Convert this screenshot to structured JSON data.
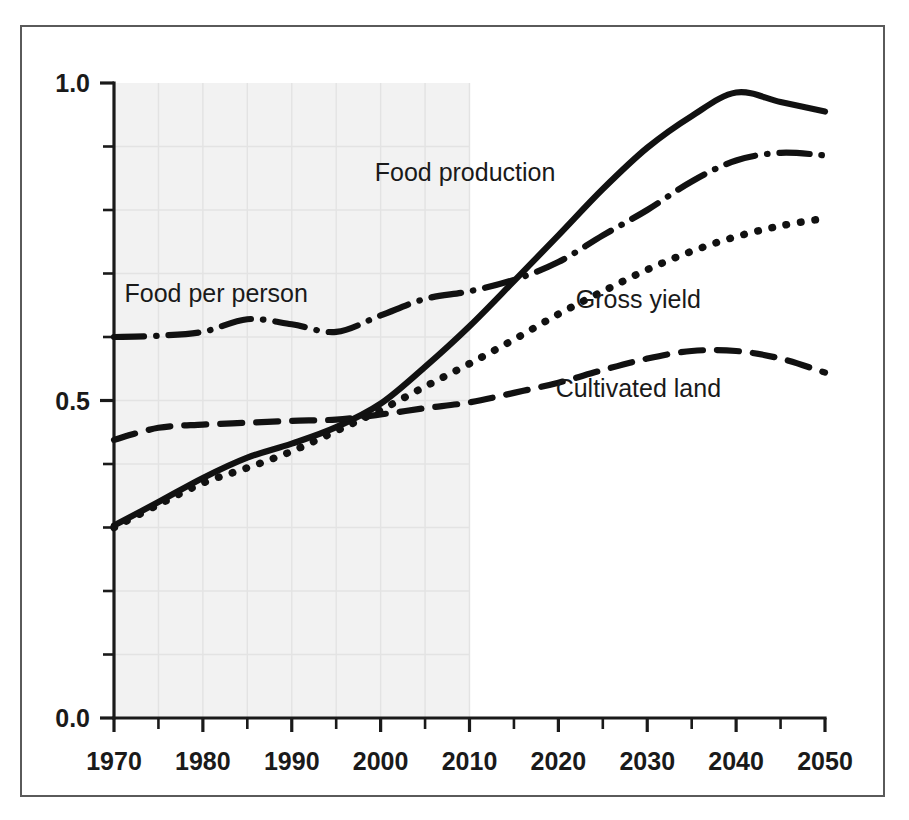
{
  "chart_data": {
    "type": "line",
    "title": "",
    "subtitle": "",
    "xlabel": "",
    "ylabel": "",
    "xlim": [
      1970,
      2050
    ],
    "ylim": [
      0.0,
      1.0
    ],
    "grid": true,
    "grid_note": "faint light-gray grid over shaded historical band",
    "legend_position": "inline-annotations",
    "x_tick_labels": [
      "1970",
      "1980",
      "1990",
      "2000",
      "2010",
      "2020",
      "2030",
      "2040",
      "2050"
    ],
    "x_major_ticks": [
      1970,
      1980,
      1990,
      2000,
      2010,
      2020,
      2030,
      2040,
      2050
    ],
    "x_minor_ticks": [
      1975,
      1985,
      1995,
      2005,
      2015,
      2025,
      2035,
      2045
    ],
    "y_tick_labels": [
      "0.0",
      "0.5",
      "1.0"
    ],
    "y_major_ticks": [
      0.0,
      0.5,
      1.0
    ],
    "y_minor_ticks": [
      0.1,
      0.2,
      0.3,
      0.4,
      0.6,
      0.7,
      0.8,
      0.9
    ],
    "shaded_region": {
      "label": "historical",
      "x_from": 1970,
      "x_to": 2010,
      "color": "#f2f2f2"
    },
    "x": [
      1970,
      1975,
      1980,
      1985,
      1990,
      1995,
      2000,
      2005,
      2010,
      2015,
      2020,
      2025,
      2030,
      2035,
      2040,
      2045,
      2050
    ],
    "series": [
      {
        "name": "Food production",
        "style": "solid",
        "color": "#111111",
        "label_text": "Food production",
        "values": [
          0.303,
          0.34,
          0.378,
          0.41,
          0.432,
          0.458,
          0.495,
          0.553,
          0.617,
          0.688,
          0.76,
          0.833,
          0.898,
          0.948,
          0.985,
          0.97,
          0.955
        ]
      },
      {
        "name": "Food per person",
        "style": "dash-dot",
        "color": "#111111",
        "label_text": "Food per person",
        "values": [
          0.6,
          0.602,
          0.608,
          0.628,
          0.62,
          0.608,
          0.634,
          0.66,
          0.672,
          0.69,
          0.718,
          0.76,
          0.8,
          0.845,
          0.878,
          0.89,
          0.886
        ]
      },
      {
        "name": "Gross yield",
        "style": "dotted",
        "color": "#111111",
        "label_text": "Gross yield",
        "values": [
          0.3,
          0.336,
          0.37,
          0.394,
          0.42,
          0.452,
          0.485,
          0.522,
          0.558,
          0.596,
          0.636,
          0.672,
          0.706,
          0.735,
          0.758,
          0.775,
          0.787
        ]
      },
      {
        "name": "Cultivated land",
        "style": "dashed",
        "color": "#111111",
        "label_text": "Cultivated land",
        "values": [
          0.438,
          0.457,
          0.462,
          0.465,
          0.468,
          0.47,
          0.478,
          0.488,
          0.497,
          0.512,
          0.528,
          0.548,
          0.566,
          0.578,
          0.578,
          0.566,
          0.544
        ]
      }
    ],
    "annotations": [
      {
        "text": "Food per person",
        "x": 1981.5,
        "y": 0.655
      },
      {
        "text": "Food production",
        "x": 2009.5,
        "y": 0.845
      },
      {
        "text": "Gross yield",
        "x": 2029.0,
        "y": 0.645
      },
      {
        "text": "Cultivated land",
        "x": 2029.0,
        "y": 0.505
      }
    ]
  },
  "axes": {
    "y_labels": [
      {
        "text": "1.0",
        "value": 1.0
      },
      {
        "text": "0.5",
        "value": 0.5
      },
      {
        "text": "0.0",
        "value": 0.0
      }
    ],
    "x_labels": [
      {
        "text": "1970",
        "value": 1970
      },
      {
        "text": "1980",
        "value": 1980
      },
      {
        "text": "1990",
        "value": 1990
      },
      {
        "text": "2000",
        "value": 2000
      },
      {
        "text": "2010",
        "value": 2010
      },
      {
        "text": "2020",
        "value": 2020
      },
      {
        "text": "2030",
        "value": 2030
      },
      {
        "text": "2040",
        "value": 2040
      },
      {
        "text": "2050",
        "value": 2050
      }
    ]
  },
  "colors": {
    "axis": "#1a1a1a",
    "frame": "#5a5a5a",
    "grid": "#e3e3e3",
    "shade": "#f2f2f2",
    "ink": "#111111",
    "page": "#ffffff"
  }
}
